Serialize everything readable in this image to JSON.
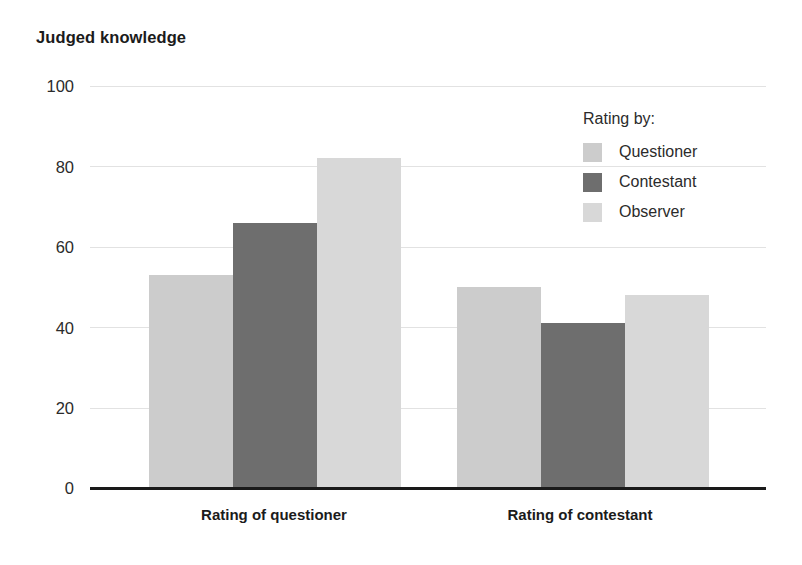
{
  "chart_data": {
    "type": "bar",
    "title": "Judged knowledge",
    "xlabel": "",
    "ylabel": "",
    "ylim": [
      0,
      100
    ],
    "yticks": [
      0,
      20,
      40,
      60,
      80,
      100
    ],
    "grid": true,
    "legend_position": "upper right",
    "legend_title": "Rating by:",
    "categories": [
      "Rating of questioner",
      "Rating of contestant"
    ],
    "series": [
      {
        "name": "Questioner",
        "values": [
          53,
          50
        ],
        "color": "#cccccc"
      },
      {
        "name": "Contestant",
        "values": [
          66,
          41
        ],
        "color": "#6e6e6e"
      },
      {
        "name": "Observer",
        "values": [
          82,
          48
        ],
        "color": "#d8d8d8"
      }
    ]
  },
  "axis": {
    "tick_0": "0",
    "tick_20": "20",
    "tick_40": "40",
    "tick_60": "60",
    "tick_80": "80",
    "tick_100": "100"
  },
  "legend": {
    "title": "Rating by:",
    "items": [
      {
        "label": "Questioner"
      },
      {
        "label": "Contestant"
      },
      {
        "label": "Observer"
      }
    ]
  },
  "colors": {
    "series_questioner": "#cccccc",
    "series_contestant": "#6e6e6e",
    "series_observer": "#d8d8d8",
    "axis": "#1a1a1a",
    "grid": "#e2e2e2",
    "text": "#1b1b1b",
    "background": "#ffffff"
  }
}
